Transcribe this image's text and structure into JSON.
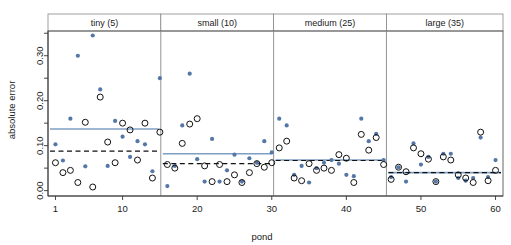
{
  "chart_data": {
    "type": "scatter",
    "title": "",
    "xlabel": "pond",
    "ylabel": "absolute error",
    "xlim": [
      0,
      61
    ],
    "ylim": [
      -0.012,
      0.355
    ],
    "grid": false,
    "legend": "none",
    "xticks": [
      1,
      10,
      20,
      30,
      40,
      50,
      60
    ],
    "xtick_labels": [
      "1",
      "10",
      "20",
      "30",
      "40",
      "50",
      "60"
    ],
    "yticks": [
      0.0,
      0.05,
      0.1,
      0.15,
      0.2,
      0.25,
      0.3,
      0.35
    ],
    "ytick_labels": [
      "0.00",
      "",
      "0.10",
      "",
      "0.20",
      "",
      "0.30",
      ""
    ],
    "panels": [
      {
        "label": "tiny (5)",
        "x_start": 0.5,
        "x_end": 15.5,
        "solid_blue_level": 0.137,
        "dashed_black_level": 0.088
      },
      {
        "label": "small (10)",
        "x_start": 15.5,
        "x_end": 30.5,
        "solid_blue_level": 0.082,
        "dashed_black_level": 0.06
      },
      {
        "label": "medium (25)",
        "x_start": 30.5,
        "x_end": 45.5,
        "solid_blue_level": 0.068,
        "dashed_black_level": 0.067
      },
      {
        "label": "large (35)",
        "x_start": 45.5,
        "x_end": 61.0,
        "solid_blue_level": 0.04,
        "dashed_black_level": 0.04
      }
    ],
    "series": [
      {
        "name": "filled-blue-points",
        "marker": "filled-circle",
        "color": "#5577a8",
        "x": [
          1,
          2,
          3,
          4,
          5,
          6,
          7,
          8,
          9,
          10,
          11,
          12,
          13,
          14,
          15,
          16,
          17,
          18,
          19,
          20,
          21,
          22,
          23,
          24,
          25,
          26,
          27,
          28,
          29,
          30,
          31,
          32,
          33,
          34,
          35,
          36,
          37,
          38,
          39,
          40,
          41,
          42,
          43,
          44,
          45,
          46,
          47,
          48,
          49,
          50,
          51,
          52,
          53,
          54,
          55,
          56,
          57,
          58,
          59,
          60
        ],
        "y": [
          0.103,
          0.067,
          0.16,
          0.3,
          0.054,
          0.345,
          0.225,
          0.055,
          0.155,
          0.12,
          0.075,
          0.11,
          0.103,
          0.043,
          0.25,
          0.01,
          0.055,
          0.145,
          0.26,
          0.07,
          0.02,
          0.115,
          0.02,
          0.045,
          0.08,
          0.02,
          0.072,
          0.062,
          0.11,
          0.085,
          0.16,
          0.145,
          0.035,
          0.055,
          0.018,
          0.05,
          0.062,
          0.068,
          0.06,
          0.035,
          0.032,
          0.16,
          0.11,
          0.126,
          0.068,
          0.03,
          0.052,
          0.02,
          0.105,
          0.058,
          0.075,
          0.02,
          0.082,
          0.082,
          0.028,
          0.022,
          0.028,
          0.118,
          0.03,
          0.068
        ]
      },
      {
        "name": "open-black-circles",
        "marker": "open-circle",
        "color": "#111111",
        "x": [
          1,
          2,
          3,
          4,
          5,
          6,
          7,
          8,
          9,
          10,
          11,
          12,
          13,
          14,
          15,
          16,
          17,
          18,
          19,
          20,
          21,
          22,
          23,
          24,
          25,
          26,
          27,
          28,
          29,
          30,
          31,
          32,
          33,
          34,
          35,
          36,
          37,
          38,
          39,
          40,
          41,
          42,
          43,
          44,
          45,
          46,
          47,
          48,
          49,
          50,
          51,
          52,
          53,
          54,
          55,
          56,
          57,
          58,
          59,
          60
        ],
        "y": [
          0.062,
          0.04,
          0.045,
          0.018,
          0.152,
          0.008,
          0.208,
          0.108,
          0.062,
          0.15,
          0.135,
          0.068,
          0.15,
          0.028,
          0.13,
          0.058,
          0.05,
          0.105,
          0.148,
          0.16,
          0.055,
          0.02,
          0.058,
          0.02,
          0.035,
          0.018,
          0.04,
          0.06,
          0.052,
          0.062,
          0.095,
          0.11,
          0.028,
          0.022,
          0.06,
          0.045,
          0.05,
          0.045,
          0.08,
          0.072,
          0.018,
          0.125,
          0.09,
          0.118,
          0.058,
          0.025,
          0.052,
          0.042,
          0.095,
          0.082,
          0.07,
          0.02,
          0.075,
          0.068,
          0.035,
          0.028,
          0.018,
          0.13,
          0.022,
          0.045
        ]
      }
    ],
    "reference_lines": [
      {
        "name": "solid-blue-reference",
        "style": "solid",
        "color": "#7f9ec4"
      },
      {
        "name": "dashed-black-reference",
        "style": "dashed",
        "color": "#111111"
      }
    ]
  },
  "colors": {
    "point_blue": "#5577a8",
    "line_blue": "#7f9ec4",
    "axis": "#333333",
    "panel_border": "#555555",
    "strip_border": "#888888",
    "background": "#ffffff"
  }
}
